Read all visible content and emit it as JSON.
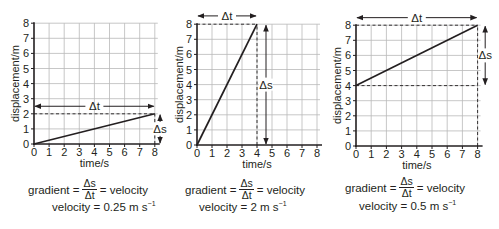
{
  "figure": {
    "panels": [
      {
        "id": "panel-1",
        "caption_prefix": "gradient =",
        "frac_num": "Δs",
        "frac_den": "Δt",
        "caption_suffix": "= velocity",
        "velocity_label": "velocity = 0.25 m s",
        "velocity_unit_exp": "−1"
      },
      {
        "id": "panel-2",
        "caption_prefix": "gradient =",
        "frac_num": "Δs",
        "frac_den": "Δt",
        "caption_suffix": "= velocity",
        "velocity_label": "velocity = 2 m s",
        "velocity_unit_exp": "−1"
      },
      {
        "id": "panel-3",
        "caption_prefix": "gradient =",
        "frac_num": "Δs",
        "frac_den": "Δt",
        "caption_suffix": "= velocity",
        "velocity_label": "velocity = 0.5 m s",
        "velocity_unit_exp": "−1"
      }
    ]
  },
  "chart_data": [
    {
      "type": "line",
      "title": "",
      "xlabel": "time/s",
      "ylabel": "displacement/m",
      "xlim": [
        0,
        8
      ],
      "ylim": [
        0,
        8
      ],
      "xticks": [
        0,
        1,
        2,
        3,
        4,
        5,
        6,
        7,
        8
      ],
      "yticks": [
        0,
        1,
        2,
        3,
        4,
        5,
        6,
        7,
        8
      ],
      "grid": true,
      "series": [
        {
          "name": "displacement",
          "x": [
            0,
            8
          ],
          "y": [
            0,
            2
          ]
        }
      ],
      "annotations": [
        {
          "type": "delta_t_arrow",
          "label": "Δt",
          "x_from": 0,
          "x_to": 8,
          "y": 2.5
        },
        {
          "type": "delta_s_arrow",
          "label": "Δs",
          "y_from": 0,
          "y_to": 2,
          "x": 8.35
        },
        {
          "type": "dashed_horizontal",
          "y": 2,
          "x_from": 0,
          "x_to": 8
        },
        {
          "type": "dashed_vertical",
          "x": 8,
          "y_from": 0,
          "y_to": 2
        }
      ],
      "gradient": 0.25,
      "velocity_text": "velocity = 0.25 m s⁻¹"
    },
    {
      "type": "line",
      "title": "",
      "xlabel": "time/s",
      "ylabel": "displacement/m",
      "xlim": [
        0,
        8
      ],
      "ylim": [
        0,
        8
      ],
      "xticks": [
        0,
        1,
        2,
        3,
        4,
        5,
        6,
        7,
        8
      ],
      "yticks": [
        0,
        1,
        2,
        3,
        4,
        5,
        6,
        7,
        8
      ],
      "grid": true,
      "series": [
        {
          "name": "displacement",
          "x": [
            0,
            4
          ],
          "y": [
            0,
            8
          ]
        }
      ],
      "annotations": [
        {
          "type": "delta_t_arrow",
          "label": "Δt",
          "x_from": 0,
          "x_to": 4,
          "y": 8.55
        },
        {
          "type": "delta_s_arrow",
          "label": "Δs",
          "y_from": 0,
          "y_to": 8,
          "x": 4.6
        },
        {
          "type": "dashed_horizontal",
          "y": 8,
          "x_from": 0,
          "x_to": 4
        },
        {
          "type": "dashed_vertical",
          "x": 4,
          "y_from": 0,
          "y_to": 8
        }
      ],
      "gradient": 2,
      "velocity_text": "velocity = 2 m s⁻¹"
    },
    {
      "type": "line",
      "title": "",
      "xlabel": "time/s",
      "ylabel": "displacement/m",
      "xlim": [
        0,
        8
      ],
      "ylim": [
        0,
        8
      ],
      "xticks": [
        0,
        1,
        2,
        3,
        4,
        5,
        6,
        7,
        8
      ],
      "yticks": [
        0,
        1,
        2,
        3,
        4,
        5,
        6,
        7,
        8
      ],
      "grid": true,
      "series": [
        {
          "name": "displacement",
          "x": [
            0,
            8
          ],
          "y": [
            4,
            8
          ]
        }
      ],
      "annotations": [
        {
          "type": "delta_t_arrow",
          "label": "Δt",
          "x_from": 0,
          "x_to": 8,
          "y": 8.5
        },
        {
          "type": "delta_s_arrow",
          "label": "Δs",
          "y_from": 4,
          "y_to": 8,
          "x": 8.5
        },
        {
          "type": "dashed_horizontal",
          "y": 8,
          "x_from": 0,
          "x_to": 8
        },
        {
          "type": "dashed_horizontal",
          "y": 4,
          "x_from": 0,
          "x_to": 8
        },
        {
          "type": "dashed_vertical",
          "x": 8,
          "y_from": 0,
          "y_to": 8
        }
      ],
      "gradient": 0.5,
      "velocity_text": "velocity = 0.5 m s⁻¹"
    }
  ],
  "layout": {
    "panels": [
      {
        "x0": 34,
        "y0": 144,
        "unit_x": 15.1,
        "unit_y": 15.1,
        "ylabel_x": 15,
        "caption_x": 28,
        "caption_y": 178,
        "vel_x": 52,
        "vel_y": 200
      },
      {
        "x0": 197,
        "y0": 145,
        "unit_x": 15.0,
        "unit_y": 15.1,
        "ylabel_x": 179,
        "caption_x": 185,
        "caption_y": 178,
        "vel_x": 199,
        "vel_y": 200
      },
      {
        "x0": 356,
        "y0": 146,
        "unit_x": 15.2,
        "unit_y": 15.1,
        "ylabel_x": 337,
        "caption_x": 345,
        "caption_y": 176,
        "vel_x": 359,
        "vel_y": 199
      }
    ]
  }
}
